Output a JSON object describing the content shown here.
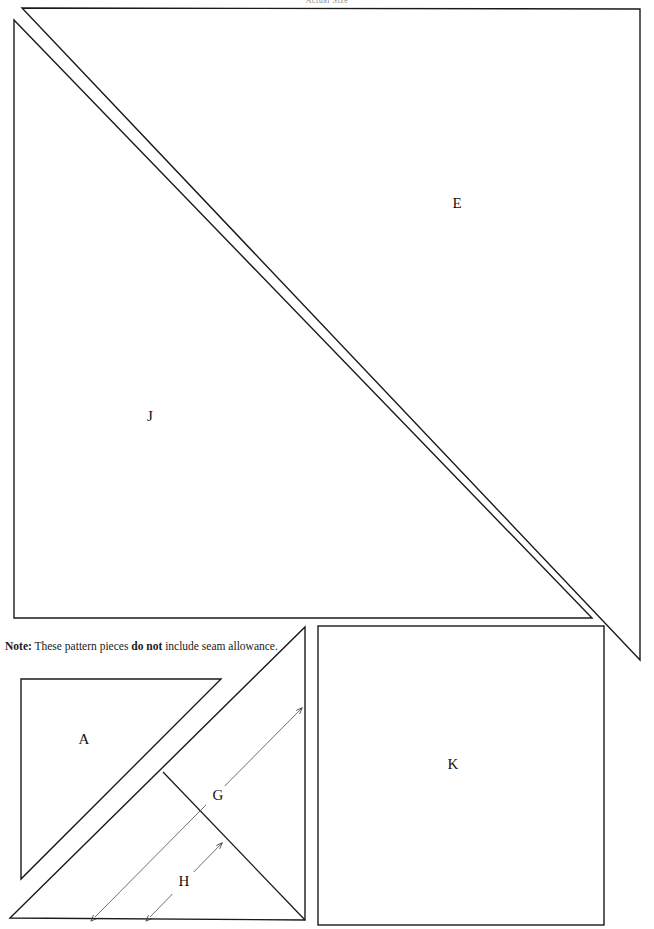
{
  "document": {
    "type": "quilt-pattern-template-sheet",
    "header_caption": "Actual Size",
    "page_width": 654,
    "page_height": 929,
    "background_color": "#ffffff",
    "line_color": "#1a1a1a",
    "arrow_color": "#4a4a4a"
  },
  "note": {
    "prefix": "Note:",
    "text_before": " These pattern pieces ",
    "emphasis": "do not",
    "text_after": " include seam allowance."
  },
  "pieces": [
    {
      "id": "E",
      "label": "E",
      "shape": "right-triangle",
      "description": "outer large right triangle, hypotenuse running from top-left to bottom-right",
      "label_x": 457,
      "label_y": 205,
      "vertices": [
        [
          22,
          8
        ],
        [
          640,
          9
        ],
        [
          640,
          660
        ]
      ]
    },
    {
      "id": "J",
      "label": "J",
      "shape": "right-triangle",
      "description": "inner large right triangle nested inside E, right angle at bottom-left",
      "label_x": 150,
      "label_y": 418,
      "vertices": [
        [
          14,
          20
        ],
        [
          14,
          618
        ],
        [
          592,
          618
        ]
      ]
    },
    {
      "id": "A",
      "label": "A",
      "shape": "right-triangle",
      "description": "small inner right triangle in lower-left block, right angle at top-left",
      "label_x": 84,
      "label_y": 741,
      "vertices": [
        [
          21,
          679
        ],
        [
          221,
          679
        ],
        [
          21,
          879
        ]
      ]
    },
    {
      "id": "K",
      "label": "K",
      "shape": "square",
      "description": "square pattern piece at lower right",
      "label_x": 453,
      "label_y": 766,
      "vertices": [
        [
          318,
          626
        ],
        [
          604,
          626
        ],
        [
          604,
          925
        ],
        [
          318,
          925
        ]
      ]
    }
  ],
  "outer_triangle_lower_left": {
    "description": "large right triangle enclosing piece A, right angle at bottom-right",
    "vertices": [
      [
        10,
        918
      ],
      [
        305,
        627
      ],
      [
        305,
        920
      ]
    ]
  },
  "inner_fold_line": {
    "description": "short line from hypotenuse of A down to the lower right hypotenuse",
    "from": [
      163,
      772
    ],
    "to": [
      305,
      920
    ]
  },
  "dimensions": [
    {
      "id": "G",
      "label": "G",
      "label_x": 218,
      "label_y": 797,
      "arrow_type": "double-headed",
      "from": [
        95,
        917
      ],
      "to": [
        302,
        708
      ]
    },
    {
      "id": "H",
      "label": "H",
      "label_x": 184,
      "label_y": 883,
      "arrow_type": "double-headed",
      "from": [
        150,
        917
      ],
      "to": [
        222,
        843
      ]
    }
  ]
}
